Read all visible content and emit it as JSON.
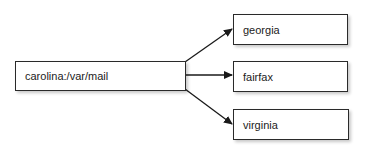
{
  "diagram": {
    "source": {
      "label": "carolina:/var/mail"
    },
    "targets": [
      {
        "label": "georgia"
      },
      {
        "label": "fairfax"
      },
      {
        "label": "virginia"
      }
    ],
    "colors": {
      "stroke": "#2a2a2a",
      "fill": "#ffffff",
      "text": "#222222"
    }
  }
}
